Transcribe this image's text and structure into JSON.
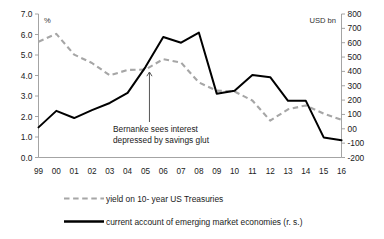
{
  "chart_data": {
    "type": "line",
    "title": "",
    "xlabel": "",
    "ylabel": "%",
    "y2label": "USD bn",
    "grid": false,
    "legend_position": "bottom",
    "categories": [
      "99",
      "00",
      "01",
      "02",
      "03",
      "04",
      "05",
      "06",
      "07",
      "08",
      "09",
      "10",
      "11",
      "12",
      "13",
      "14",
      "15",
      "16"
    ],
    "ylim": [
      0.0,
      7.0
    ],
    "ytick_labels": [
      "0.0",
      "1.0",
      "2.0",
      "3.0",
      "4.0",
      "5.0",
      "6.0",
      "7.0"
    ],
    "y2lim": [
      -200,
      800
    ],
    "y2tick_labels": [
      "-200",
      "-100",
      "00",
      "100",
      "200",
      "300",
      "400",
      "500",
      "600",
      "700",
      "800"
    ],
    "series": [
      {
        "name": "yield on 10- year US Treasuries",
        "axis": "left",
        "style": "dashed",
        "color": "#a6a6a6",
        "values": [
          5.65,
          6.03,
          5.02,
          4.61,
          4.01,
          4.27,
          4.29,
          4.8,
          4.63,
          3.66,
          3.26,
          3.22,
          2.78,
          1.8,
          2.35,
          2.54,
          2.14,
          1.84
        ]
      },
      {
        "name": "current account of emerging market economies (r. s.)",
        "axis": "right",
        "style": "solid",
        "color": "#000000",
        "values": [
          10,
          125,
          75,
          130,
          180,
          250,
          430,
          640,
          600,
          670,
          245,
          265,
          375,
          360,
          195,
          195,
          -60,
          -80
        ]
      }
    ],
    "annotations": [
      {
        "name": "bernanke-savings-glut",
        "line1": "Bernanke sees interest",
        "line2": "depressed by savings glut",
        "points_to_category": "05"
      }
    ]
  },
  "axes": {
    "left_unit": "%",
    "right_unit": "USD bn"
  },
  "legend": {
    "items": [
      {
        "label": "yield on 10- year US Treasuries",
        "style": "dashed"
      },
      {
        "label": "current account of emerging market economies (r. s.)",
        "style": "solid"
      }
    ]
  }
}
